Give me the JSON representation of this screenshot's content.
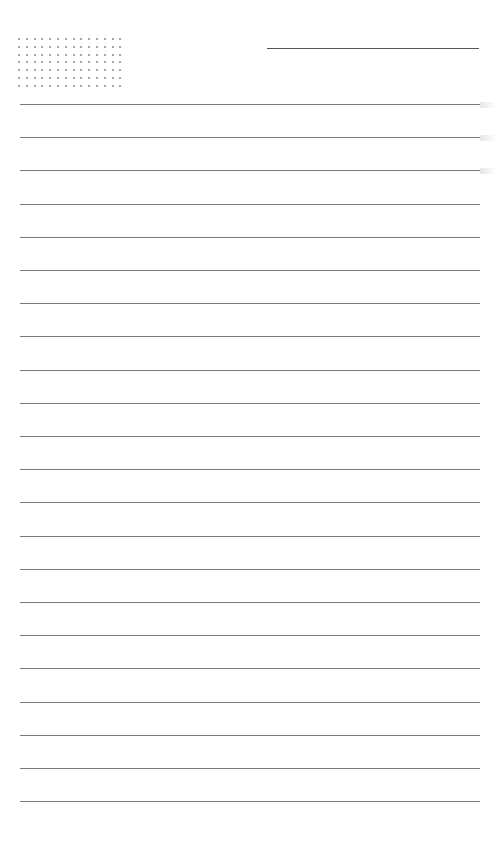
{
  "page": {
    "type": "ruled-notepaper",
    "background": "#ffffff",
    "line_color": "#7a7a7a",
    "dot_color": "#8a8a8a"
  },
  "header": {
    "dot_grid": {
      "columns": 14,
      "rows": 7
    },
    "title_line": {
      "present": true
    }
  },
  "ruled_lines": {
    "count": 22,
    "first_y": 104,
    "spacing": 33.2
  }
}
